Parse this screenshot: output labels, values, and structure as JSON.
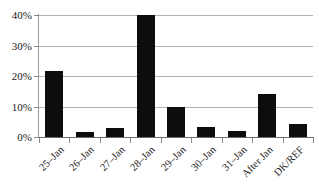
{
  "chart_data": {
    "type": "bar",
    "title": "",
    "subtitle": "",
    "xlabel": "",
    "ylabel": "",
    "categories": [
      "25–Jan",
      "26–Jan",
      "27–Jan",
      "28–Jan",
      "29–Jan",
      "30–Jan",
      "31–Jan",
      "After Jan",
      "DK/REF"
    ],
    "values": [
      21.8,
      1.8,
      2.8,
      40.0,
      10.0,
      3.2,
      2.0,
      14.2,
      4.2
    ],
    "ylim": [
      0,
      40
    ],
    "ytick_values": [
      0,
      10,
      20,
      30,
      40
    ],
    "ytick_labels": [
      "0%",
      "10%",
      "20%",
      "30%",
      "40%"
    ],
    "grid": true,
    "grid_axis": "y",
    "legend": "none",
    "bar_color": "#0d0d0d",
    "background_color": "#ffffff",
    "gridline_color": "#b3b3b3",
    "axis_color": "#8c8c8c",
    "text_color": "#1a1a1a",
    "x_label_rotation": "-45"
  }
}
